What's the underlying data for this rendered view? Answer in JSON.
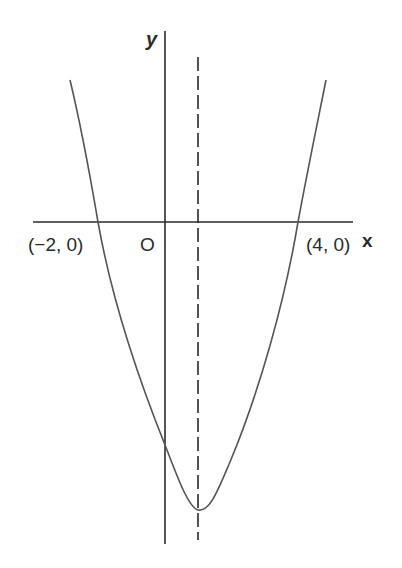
{
  "diagram": {
    "type": "parabola-graph",
    "axes": {
      "x_label": "x",
      "y_label": "y",
      "origin_label": "O"
    },
    "points": [
      {
        "label": "(−2, 0)",
        "x": -2,
        "y": 0
      },
      {
        "label": "(4, 0)",
        "x": 4,
        "y": 0
      }
    ],
    "axis_of_symmetry": {
      "x": 1,
      "style": "dashed"
    },
    "curve": {
      "shape": "upward-parabola",
      "roots": [
        -2,
        4
      ]
    },
    "colors": {
      "line": "#2a2a2a",
      "curve": "#555555",
      "background": "#ffffff"
    }
  }
}
